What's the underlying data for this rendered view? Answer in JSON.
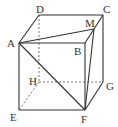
{
  "diagram": {
    "type": "cube",
    "points": {
      "A": {
        "label": "A",
        "x": 19,
        "y": 43
      },
      "B": {
        "label": "B",
        "x": 85,
        "y": 43
      },
      "C": {
        "label": "C",
        "x": 103,
        "y": 15
      },
      "D": {
        "label": "D",
        "x": 39,
        "y": 15
      },
      "E": {
        "label": "E",
        "x": 19,
        "y": 110
      },
      "F": {
        "label": "F",
        "x": 85,
        "y": 110
      },
      "G": {
        "label": "G",
        "x": 103,
        "y": 82
      },
      "H": {
        "label": "H",
        "x": 39,
        "y": 82
      },
      "M": {
        "label": "M",
        "x": 94,
        "y": 29
      }
    },
    "visible_edges": [
      [
        "A",
        "B"
      ],
      [
        "A",
        "D"
      ],
      [
        "D",
        "C"
      ],
      [
        "C",
        "B"
      ],
      [
        "A",
        "E"
      ],
      [
        "E",
        "F"
      ],
      [
        "B",
        "F"
      ],
      [
        "C",
        "G"
      ],
      [
        "G",
        "F"
      ],
      [
        "A",
        "M"
      ],
      [
        "A",
        "F"
      ],
      [
        "M",
        "F"
      ]
    ],
    "hidden_edges": [
      [
        "D",
        "H"
      ],
      [
        "H",
        "G"
      ],
      [
        "H",
        "E"
      ]
    ],
    "colors": {
      "line": "#333333",
      "hidden_line": "#666666",
      "background": "#ffffff"
    }
  }
}
